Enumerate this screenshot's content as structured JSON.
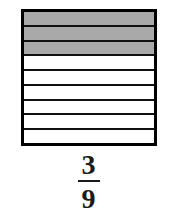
{
  "figure": {
    "type": "fraction-area-model",
    "orientation": "horizontal-bands",
    "total_parts": 9,
    "shaded_parts": 3,
    "unshaded_parts": 6,
    "shaded_color": "#a9a9a9",
    "unshaded_color": "#ffffff",
    "outline_color": "#000000",
    "divider_color": "#111111",
    "bands": [
      {
        "index": 1,
        "state": "shaded"
      },
      {
        "index": 2,
        "state": "shaded"
      },
      {
        "index": 3,
        "state": "shaded"
      },
      {
        "index": 4,
        "state": "unshaded"
      },
      {
        "index": 5,
        "state": "unshaded"
      },
      {
        "index": 6,
        "state": "unshaded"
      },
      {
        "index": 7,
        "state": "unshaded"
      },
      {
        "index": 8,
        "state": "unshaded"
      },
      {
        "index": 9,
        "state": "unshaded"
      }
    ]
  },
  "label": {
    "numerator": "3",
    "denominator": "9"
  }
}
